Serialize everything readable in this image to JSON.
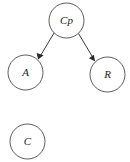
{
  "diagram": {
    "background_color": "#ffffff",
    "node_stroke_color": "#4a4a4a",
    "edge_color": "#3a3a3a",
    "label_color": "#1a1a1a",
    "nodes": [
      {
        "id": "Cp",
        "label": "Cp",
        "cx": 66.5,
        "cy": 20.5,
        "r": 17.5
      },
      {
        "id": "A",
        "label": "A",
        "cx": 25.5,
        "cy": 72.5,
        "r": 17.5
      },
      {
        "id": "R",
        "label": "R",
        "cx": 107.5,
        "cy": 74.5,
        "r": 17.5
      },
      {
        "id": "C",
        "label": "C",
        "cx": 27.5,
        "cy": 141.5,
        "r": 17.5
      }
    ],
    "edges": [
      {
        "from": "Cp",
        "to": "A",
        "directed": true,
        "x1": 54.0,
        "y1": 33.0,
        "x2": 38.5,
        "y2": 59.0
      },
      {
        "from": "Cp",
        "to": "R",
        "directed": true,
        "x1": 78.5,
        "y1": 33.5,
        "x2": 95.0,
        "y2": 61.0
      }
    ]
  }
}
